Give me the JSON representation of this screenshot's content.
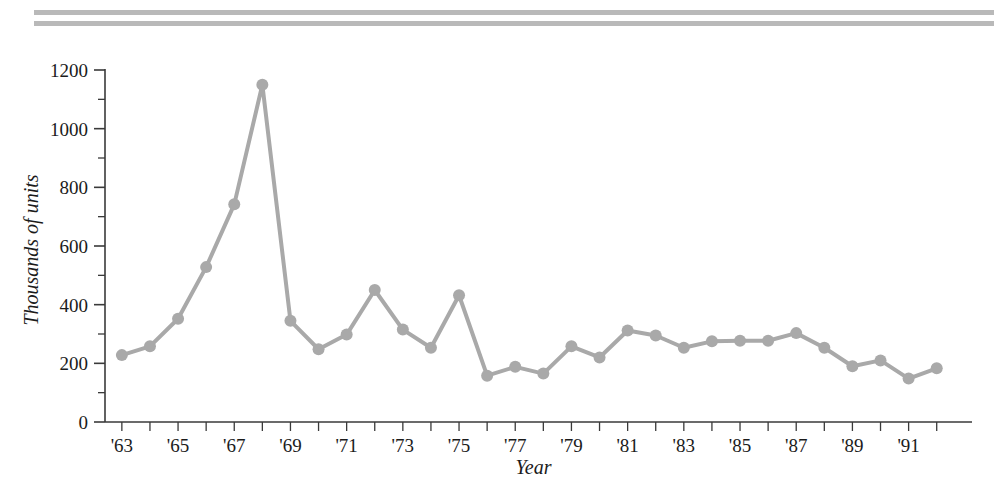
{
  "figure": {
    "name": "line-chart-figure",
    "background_color": "#ffffff",
    "rules": {
      "color": "#b9b9b9",
      "count": 2
    }
  },
  "chart_data": {
    "type": "line",
    "title": "",
    "subtitle": "",
    "xlabel": "Year",
    "ylabel": "Thousands of units",
    "xlim": [
      1962.5,
      1992.5
    ],
    "ylim": [
      0,
      1250
    ],
    "grid": false,
    "legend": null,
    "legend_position": "none",
    "series_color": "#a9a9a9",
    "marker": "circle",
    "marker_size": 9,
    "line_width": 4,
    "x": [
      1963,
      1964,
      1965,
      1966,
      1967,
      1968,
      1969,
      1970,
      1971,
      1972,
      1973,
      1974,
      1975,
      1976,
      1977,
      1978,
      1979,
      1980,
      1981,
      1982,
      1983,
      1984,
      1985,
      1986,
      1987,
      1988,
      1989,
      1990,
      1991,
      1992
    ],
    "categories": [
      "'63",
      "'64",
      "'65",
      "'66",
      "'67",
      "'68",
      "'69",
      "'70",
      "'71",
      "'72",
      "'73",
      "'74",
      "'75",
      "'76",
      "'77",
      "'78",
      "'79",
      "'80",
      "'81",
      "'82",
      "'83",
      "'84",
      "'85",
      "'86",
      "'87",
      "'88",
      "'89",
      "'90",
      "'91",
      "'92"
    ],
    "values": [
      228,
      258,
      352,
      528,
      742,
      1150,
      345,
      248,
      298,
      450,
      315,
      253,
      432,
      158,
      188,
      165,
      258,
      220,
      312,
      295,
      253,
      275,
      277,
      277,
      303,
      253,
      190,
      210,
      148,
      183
    ],
    "series": [
      {
        "name": "units",
        "values": [
          228,
          258,
          352,
          528,
          742,
          1150,
          345,
          248,
          298,
          450,
          315,
          253,
          432,
          158,
          188,
          165,
          258,
          220,
          312,
          295,
          253,
          275,
          277,
          277,
          303,
          253,
          190,
          210,
          148,
          183
        ]
      }
    ],
    "y_ticks": [
      0,
      200,
      400,
      600,
      800,
      1000,
      1200
    ],
    "y_tick_labels": [
      "0",
      "200",
      "400",
      "600",
      "800",
      "1000",
      "1200"
    ],
    "y_minor_ticks": [
      100,
      300,
      500,
      700,
      900,
      1100
    ],
    "x_ticks": [
      1963,
      1964,
      1965,
      1966,
      1967,
      1968,
      1969,
      1970,
      1971,
      1972,
      1973,
      1974,
      1975,
      1976,
      1977,
      1978,
      1979,
      1980,
      1981,
      1982,
      1983,
      1984,
      1985,
      1986,
      1987,
      1988,
      1989,
      1990,
      1991,
      1992
    ],
    "x_tick_labels": [
      "'63",
      "",
      "'65",
      "",
      "'67",
      "",
      "'69",
      "",
      "'71",
      "",
      "'73",
      "",
      "'75",
      "",
      "'77",
      "",
      "'79",
      "",
      "'81",
      "",
      "'83",
      "",
      "'85",
      "",
      "'87",
      "",
      "'89",
      "",
      "'91",
      ""
    ],
    "x_labeled_years": [
      "'63",
      "'65",
      "'67",
      "'69",
      "'71",
      "'73",
      "'75",
      "'77",
      "'79",
      "'81",
      "'83",
      "'85",
      "'87",
      "'89",
      "'91"
    ],
    "annotations": []
  }
}
